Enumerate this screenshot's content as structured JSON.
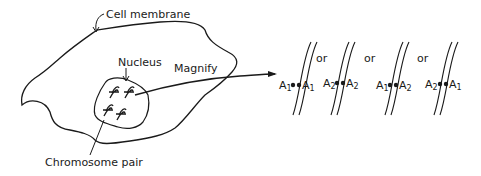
{
  "labels": {
    "cell_membrane": "Cell membrane",
    "nucleus": "Nucleus",
    "magnify": "Magnify",
    "chromosome_pair": "Chromosome pair"
  },
  "connector": "or",
  "pairs": [
    {
      "left": {
        "base": "A",
        "sub": "1"
      },
      "right": {
        "base": "A",
        "sub": "1"
      }
    },
    {
      "left": {
        "base": "A",
        "sub": "2"
      },
      "right": {
        "base": "A",
        "sub": "2"
      }
    },
    {
      "left": {
        "base": "A",
        "sub": "1"
      },
      "right": {
        "base": "A",
        "sub": "2"
      }
    },
    {
      "left": {
        "base": "A",
        "sub": "2"
      },
      "right": {
        "base": "A",
        "sub": "1"
      }
    }
  ],
  "colors": {
    "ink": "#1a1a1a",
    "background": "#ffffff"
  }
}
